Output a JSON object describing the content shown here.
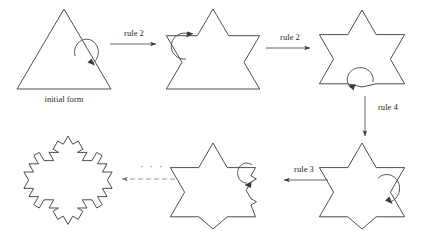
{
  "figure": {
    "name": "koch-snowflake-production-diagram",
    "width": 426,
    "height": 240,
    "background": "#ffffff",
    "ink_color": "#2b2b2b"
  },
  "labels": {
    "initial_form": "initial form",
    "rule2_first": "rule 2",
    "rule2_second": "rule 2",
    "rule4": "rule 4",
    "rule3": "rule 3",
    "ellipsis": "· · ·"
  },
  "stages": [
    {
      "id": "stage-1",
      "label": "initial form",
      "description": "equilateral triangle, apex up",
      "koch_level": 0,
      "bumped_sides": 0,
      "center": [
        64,
        48
      ],
      "radius": 44
    },
    {
      "id": "stage-2",
      "label": "",
      "description": "triangle with koch bump on two sides",
      "koch_level": 1,
      "bumped_sides": 2,
      "center": [
        213,
        48
      ],
      "radius": 44
    },
    {
      "id": "stage-3",
      "label": "",
      "description": "triangle with koch bumps on all sides but bottom",
      "koch_level": 1,
      "bumped_sides": 3,
      "center": [
        362,
        48
      ],
      "radius": 40
    },
    {
      "id": "stage-4",
      "label": "",
      "description": "six pointed koch star, level one complete",
      "koch_level": 1,
      "bumped_sides": 3,
      "center": [
        362,
        183
      ],
      "radius": 40
    },
    {
      "id": "stage-5",
      "label": "",
      "description": "six pointed koch star with level two subdivision in progress on right",
      "koch_level": 2,
      "bumped_sides": 4,
      "center": [
        213,
        183
      ],
      "radius": 40
    },
    {
      "id": "stage-6",
      "label": "",
      "description": "complete level two koch snowflake",
      "koch_level": 2,
      "bumped_sides": 12,
      "center": [
        68,
        183
      ],
      "radius": 40
    }
  ],
  "transitions": [
    {
      "id": "transition-1",
      "label": "rule 2",
      "from": "stage-1",
      "to": "stage-2",
      "direction": "right",
      "style": "solid"
    },
    {
      "id": "transition-2",
      "label": "rule 2",
      "from": "stage-2",
      "to": "stage-3",
      "direction": "right",
      "style": "solid"
    },
    {
      "id": "transition-3",
      "label": "rule 4",
      "from": "stage-3",
      "to": "stage-4",
      "direction": "down",
      "style": "solid"
    },
    {
      "id": "transition-4",
      "label": "rule 3",
      "from": "stage-4",
      "to": "stage-5",
      "direction": "left",
      "style": "solid"
    },
    {
      "id": "transition-5",
      "label": "· · ·",
      "from": "stage-5",
      "to": "stage-6",
      "direction": "left",
      "style": "dashed"
    }
  ],
  "turtle_markers": [
    {
      "id": "marker-1",
      "on": "stage-1",
      "note": "curved turtle arrow on right side of triangle"
    },
    {
      "id": "marker-2",
      "on": "stage-2",
      "note": "curved turtle arrow on upper left edge"
    },
    {
      "id": "marker-3",
      "on": "stage-3",
      "note": "curved turtle arrow on bottom edge"
    },
    {
      "id": "marker-4",
      "on": "stage-4",
      "note": "curved turtle arrow on lower right edge"
    },
    {
      "id": "marker-5",
      "on": "stage-5",
      "note": "curved turtle arrow on right subdivided edge"
    }
  ]
}
